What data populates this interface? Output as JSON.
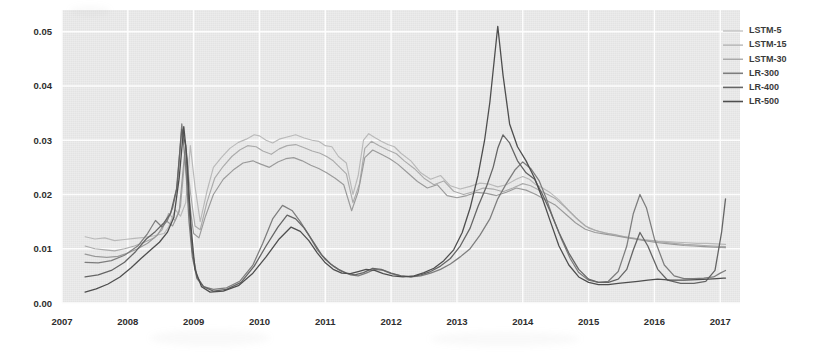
{
  "chart_data": {
    "type": "line",
    "title": "",
    "xlabel": "",
    "ylabel": "",
    "xlim": [
      2007.0,
      2017.3
    ],
    "ylim": [
      0.0,
      0.054
    ],
    "grid": true,
    "legend_position": "top-right",
    "x_ticks": [
      "2007",
      "2008",
      "2009",
      "2010",
      "2011",
      "2012",
      "2013",
      "2014",
      "2015",
      "2016",
      "2017"
    ],
    "x_tick_values": [
      2007,
      2008,
      2009,
      2010,
      2011,
      2012,
      2013,
      2014,
      2015,
      2016,
      2017
    ],
    "y_ticks": [
      "0.00",
      "0.01",
      "0.02",
      "0.03",
      "0.04",
      "0.05"
    ],
    "y_tick_values": [
      0.0,
      0.01,
      0.02,
      0.03,
      0.04,
      0.05
    ],
    "series": [
      {
        "name": "LSTM-5",
        "color": "#b9b9b9",
        "width": 1.15,
        "x": [
          2007.35,
          2007.5,
          2007.65,
          2007.8,
          2007.95,
          2008.1,
          2008.25,
          2008.4,
          2008.55,
          2008.62,
          2008.72,
          2008.8,
          2008.88,
          2008.95,
          2009.02,
          2009.1,
          2009.2,
          2009.3,
          2009.42,
          2009.55,
          2009.68,
          2009.8,
          2009.92,
          2010.0,
          2010.1,
          2010.2,
          2010.3,
          2010.42,
          2010.55,
          2010.68,
          2010.8,
          2010.9,
          2011.0,
          2011.1,
          2011.2,
          2011.32,
          2011.42,
          2011.5,
          2011.58,
          2011.66,
          2011.75,
          2011.85,
          2011.95,
          2012.05,
          2012.15,
          2012.3,
          2012.45,
          2012.6,
          2012.75,
          2012.9,
          2013.05,
          2013.2,
          2013.35,
          2013.5,
          2013.62,
          2013.75,
          2013.9,
          2014.0,
          2014.1,
          2014.2,
          2014.3,
          2014.42,
          2014.55,
          2014.7,
          2014.85,
          2015.0,
          2015.15,
          2015.3,
          2015.45,
          2015.6,
          2015.75,
          2015.9,
          2016.05,
          2016.2,
          2016.35,
          2016.5,
          2016.65,
          2016.8,
          2016.95,
          2017.08
        ],
        "y": [
          0.0122,
          0.0118,
          0.012,
          0.0115,
          0.0117,
          0.0119,
          0.0121,
          0.0124,
          0.0128,
          0.014,
          0.0172,
          0.016,
          0.0185,
          0.029,
          0.0215,
          0.015,
          0.0205,
          0.025,
          0.0268,
          0.0285,
          0.0296,
          0.0302,
          0.031,
          0.0308,
          0.03,
          0.0295,
          0.0302,
          0.0306,
          0.031,
          0.0304,
          0.03,
          0.0298,
          0.029,
          0.0288,
          0.027,
          0.0258,
          0.02,
          0.0235,
          0.03,
          0.0312,
          0.0305,
          0.0298,
          0.0292,
          0.0288,
          0.0276,
          0.0262,
          0.024,
          0.0228,
          0.0235,
          0.0216,
          0.021,
          0.0215,
          0.0221,
          0.0219,
          0.0214,
          0.0218,
          0.0228,
          0.0233,
          0.0228,
          0.0218,
          0.0212,
          0.0203,
          0.019,
          0.017,
          0.0152,
          0.0138,
          0.0132,
          0.0128,
          0.0124,
          0.0121,
          0.0118,
          0.0116,
          0.0114,
          0.0113,
          0.0112,
          0.0111,
          0.011,
          0.011,
          0.0109,
          0.0108
        ]
      },
      {
        "name": "LSTM-15",
        "color": "#ababab",
        "width": 1.15,
        "x": [
          2007.35,
          2007.5,
          2007.65,
          2007.8,
          2007.95,
          2008.1,
          2008.25,
          2008.4,
          2008.52,
          2008.62,
          2008.72,
          2008.8,
          2008.88,
          2008.95,
          2009.02,
          2009.1,
          2009.2,
          2009.32,
          2009.45,
          2009.58,
          2009.7,
          2009.82,
          2009.95,
          2010.05,
          2010.18,
          2010.3,
          2010.42,
          2010.55,
          2010.68,
          2010.8,
          2010.92,
          2011.02,
          2011.12,
          2011.22,
          2011.32,
          2011.42,
          2011.52,
          2011.6,
          2011.7,
          2011.82,
          2011.95,
          2012.08,
          2012.2,
          2012.35,
          2012.5,
          2012.65,
          2012.8,
          2012.95,
          2013.1,
          2013.25,
          2013.4,
          2013.55,
          2013.7,
          2013.85,
          2014.0,
          2014.12,
          2014.25,
          2014.38,
          2014.5,
          2014.65,
          2014.8,
          2014.95,
          2015.1,
          2015.25,
          2015.4,
          2015.55,
          2015.7,
          2015.85,
          2016.0,
          2016.15,
          2016.3,
          2016.45,
          2016.6,
          2016.75,
          2016.9,
          2017.08
        ],
        "y": [
          0.0105,
          0.01,
          0.0098,
          0.0096,
          0.01,
          0.0105,
          0.0112,
          0.012,
          0.0135,
          0.0165,
          0.0152,
          0.0178,
          0.0285,
          0.0205,
          0.0142,
          0.0135,
          0.0185,
          0.023,
          0.0252,
          0.027,
          0.0282,
          0.029,
          0.0288,
          0.028,
          0.0274,
          0.0284,
          0.029,
          0.0292,
          0.0286,
          0.028,
          0.0276,
          0.027,
          0.0262,
          0.025,
          0.0238,
          0.0185,
          0.022,
          0.0285,
          0.0298,
          0.029,
          0.0282,
          0.0275,
          0.0262,
          0.0248,
          0.023,
          0.0218,
          0.0225,
          0.0206,
          0.02,
          0.0205,
          0.0212,
          0.021,
          0.0205,
          0.0212,
          0.022,
          0.0216,
          0.0208,
          0.02,
          0.0192,
          0.0176,
          0.0158,
          0.0142,
          0.0134,
          0.0129,
          0.0126,
          0.0122,
          0.0119,
          0.0116,
          0.0114,
          0.0112,
          0.011,
          0.0108,
          0.0107,
          0.0106,
          0.0105,
          0.0104
        ]
      },
      {
        "name": "LSTM-30",
        "color": "#9a9a9a",
        "width": 1.15,
        "x": [
          2007.35,
          2007.5,
          2007.68,
          2007.85,
          2008.0,
          2008.15,
          2008.3,
          2008.45,
          2008.58,
          2008.68,
          2008.78,
          2008.86,
          2008.93,
          2009.0,
          2009.08,
          2009.18,
          2009.3,
          2009.45,
          2009.6,
          2009.75,
          2009.9,
          2010.02,
          2010.15,
          2010.28,
          2010.4,
          2010.52,
          2010.65,
          2010.78,
          2010.9,
          2011.02,
          2011.15,
          2011.28,
          2011.4,
          2011.5,
          2011.6,
          2011.72,
          2011.85,
          2011.98,
          2012.1,
          2012.25,
          2012.4,
          2012.55,
          2012.7,
          2012.85,
          2013.0,
          2013.15,
          2013.3,
          2013.45,
          2013.6,
          2013.75,
          2013.9,
          2014.05,
          2014.2,
          2014.35,
          2014.5,
          2014.65,
          2014.8,
          2014.95,
          2015.1,
          2015.25,
          2015.4,
          2015.55,
          2015.7,
          2015.85,
          2016.0,
          2016.15,
          2016.3,
          2016.45,
          2016.6,
          2016.75,
          2016.9,
          2017.08
        ],
        "y": [
          0.009,
          0.0086,
          0.0084,
          0.0086,
          0.0092,
          0.01,
          0.011,
          0.0125,
          0.0152,
          0.0142,
          0.0168,
          0.0272,
          0.019,
          0.0128,
          0.012,
          0.016,
          0.02,
          0.0228,
          0.0245,
          0.0258,
          0.0262,
          0.0256,
          0.025,
          0.026,
          0.0266,
          0.0268,
          0.0262,
          0.0254,
          0.0248,
          0.024,
          0.023,
          0.0218,
          0.017,
          0.0205,
          0.0268,
          0.0282,
          0.0274,
          0.0266,
          0.0256,
          0.024,
          0.0224,
          0.0212,
          0.0218,
          0.0198,
          0.0194,
          0.0198,
          0.0204,
          0.0202,
          0.0198,
          0.0204,
          0.0212,
          0.0208,
          0.02,
          0.019,
          0.018,
          0.0164,
          0.0148,
          0.0136,
          0.013,
          0.0127,
          0.0124,
          0.0121,
          0.0118,
          0.0115,
          0.0112,
          0.011,
          0.0108,
          0.0106,
          0.0105,
          0.0104,
          0.0103,
          0.0102
        ]
      },
      {
        "name": "LR-300",
        "color": "#7d7d7d",
        "width": 1.25,
        "x": [
          2007.35,
          2007.55,
          2007.75,
          2007.95,
          2008.15,
          2008.3,
          2008.42,
          2008.52,
          2008.6,
          2008.68,
          2008.75,
          2008.82,
          2008.88,
          2008.93,
          2008.98,
          2009.05,
          2009.15,
          2009.3,
          2009.5,
          2009.7,
          2009.9,
          2010.05,
          2010.2,
          2010.35,
          2010.5,
          2010.62,
          2010.75,
          2010.88,
          2011.0,
          2011.12,
          2011.25,
          2011.38,
          2011.5,
          2011.62,
          2011.75,
          2011.88,
          2012.0,
          2012.15,
          2012.3,
          2012.45,
          2012.6,
          2012.75,
          2012.9,
          2013.05,
          2013.2,
          2013.35,
          2013.5,
          2013.62,
          2013.75,
          2013.88,
          2014.0,
          2014.12,
          2014.25,
          2014.35,
          2014.45,
          2014.58,
          2014.72,
          2014.85,
          2015.0,
          2015.15,
          2015.3,
          2015.45,
          2015.58,
          2015.68,
          2015.78,
          2015.88,
          2016.0,
          2016.15,
          2016.3,
          2016.45,
          2016.6,
          2016.75,
          2016.9,
          2017.0,
          2017.08
        ],
        "y": [
          0.0075,
          0.0074,
          0.0078,
          0.0088,
          0.0105,
          0.0128,
          0.0152,
          0.014,
          0.0152,
          0.0175,
          0.0215,
          0.033,
          0.025,
          0.015,
          0.0085,
          0.0045,
          0.003,
          0.0025,
          0.0028,
          0.004,
          0.007,
          0.011,
          0.0155,
          0.018,
          0.017,
          0.015,
          0.0125,
          0.0098,
          0.008,
          0.0068,
          0.0058,
          0.0052,
          0.005,
          0.0055,
          0.0062,
          0.006,
          0.0054,
          0.005,
          0.0048,
          0.005,
          0.0055,
          0.0062,
          0.0072,
          0.0085,
          0.01,
          0.0125,
          0.0155,
          0.0192,
          0.022,
          0.0245,
          0.026,
          0.0248,
          0.0225,
          0.0195,
          0.016,
          0.012,
          0.0082,
          0.0056,
          0.0042,
          0.0038,
          0.004,
          0.0058,
          0.0105,
          0.0165,
          0.02,
          0.0175,
          0.0118,
          0.007,
          0.005,
          0.0045,
          0.0045,
          0.0046,
          0.0048,
          0.0055,
          0.006
        ]
      },
      {
        "name": "LR-400",
        "color": "#656565",
        "width": 1.3,
        "x": [
          2007.35,
          2007.55,
          2007.75,
          2007.95,
          2008.12,
          2008.28,
          2008.42,
          2008.55,
          2008.65,
          2008.74,
          2008.82,
          2008.88,
          2008.93,
          2008.98,
          2009.05,
          2009.15,
          2009.3,
          2009.5,
          2009.72,
          2009.92,
          2010.1,
          2010.28,
          2010.42,
          2010.55,
          2010.68,
          2010.82,
          2010.95,
          2011.08,
          2011.2,
          2011.32,
          2011.45,
          2011.58,
          2011.72,
          2011.85,
          2012.0,
          2012.15,
          2012.3,
          2012.45,
          2012.6,
          2012.75,
          2012.9,
          2013.05,
          2013.2,
          2013.32,
          2013.45,
          2013.55,
          2013.62,
          2013.7,
          2013.8,
          2013.92,
          2014.05,
          2014.18,
          2014.3,
          2014.42,
          2014.55,
          2014.7,
          2014.85,
          2015.0,
          2015.15,
          2015.3,
          2015.45,
          2015.58,
          2015.68,
          2015.78,
          2015.9,
          2016.05,
          2016.2,
          2016.4,
          2016.6,
          2016.78,
          2016.92,
          2017.02,
          2017.08
        ],
        "y": [
          0.0048,
          0.0052,
          0.006,
          0.0075,
          0.0095,
          0.0118,
          0.0132,
          0.0148,
          0.0165,
          0.021,
          0.032,
          0.029,
          0.018,
          0.0095,
          0.0048,
          0.003,
          0.0022,
          0.0025,
          0.0038,
          0.0068,
          0.0105,
          0.014,
          0.0162,
          0.0155,
          0.0138,
          0.0112,
          0.0088,
          0.0072,
          0.0062,
          0.0055,
          0.0052,
          0.0056,
          0.0064,
          0.0062,
          0.0055,
          0.005,
          0.0048,
          0.0052,
          0.0058,
          0.0068,
          0.0082,
          0.0105,
          0.0138,
          0.0178,
          0.0215,
          0.025,
          0.0285,
          0.031,
          0.0295,
          0.0262,
          0.024,
          0.0228,
          0.02,
          0.0168,
          0.013,
          0.0092,
          0.0062,
          0.0044,
          0.0038,
          0.0038,
          0.0044,
          0.0062,
          0.0098,
          0.013,
          0.0105,
          0.0062,
          0.0042,
          0.0036,
          0.0036,
          0.004,
          0.006,
          0.013,
          0.0192
        ]
      },
      {
        "name": "LR-500",
        "color": "#4e4e4e",
        "width": 1.3,
        "x": [
          2007.35,
          2007.52,
          2007.7,
          2007.88,
          2008.05,
          2008.2,
          2008.35,
          2008.48,
          2008.6,
          2008.7,
          2008.78,
          2008.85,
          2008.9,
          2008.96,
          2009.02,
          2009.12,
          2009.25,
          2009.45,
          2009.68,
          2009.9,
          2010.1,
          2010.3,
          2010.48,
          2010.62,
          2010.75,
          2010.88,
          2011.0,
          2011.12,
          2011.25,
          2011.38,
          2011.5,
          2011.62,
          2011.75,
          2011.88,
          2012.02,
          2012.18,
          2012.35,
          2012.5,
          2012.65,
          2012.8,
          2012.95,
          2013.08,
          2013.2,
          2013.32,
          2013.42,
          2013.5,
          2013.56,
          2013.62,
          2013.7,
          2013.8,
          2013.92,
          2014.05,
          2014.18,
          2014.3,
          2014.42,
          2014.55,
          2014.7,
          2014.85,
          2015.0,
          2015.15,
          2015.3,
          2015.45,
          2015.6,
          2015.75,
          2015.9,
          2016.05,
          2016.25,
          2016.45,
          2016.65,
          2016.82,
          2016.95,
          2017.05,
          2017.08
        ],
        "y": [
          0.002,
          0.0026,
          0.0035,
          0.0048,
          0.0065,
          0.0082,
          0.0098,
          0.0112,
          0.013,
          0.0158,
          0.023,
          0.0325,
          0.0265,
          0.014,
          0.0062,
          0.003,
          0.002,
          0.0022,
          0.0032,
          0.0055,
          0.0085,
          0.0118,
          0.014,
          0.0132,
          0.0115,
          0.0092,
          0.0074,
          0.0062,
          0.0055,
          0.0054,
          0.0058,
          0.0062,
          0.006,
          0.0054,
          0.005,
          0.0048,
          0.005,
          0.0056,
          0.0064,
          0.0078,
          0.0098,
          0.013,
          0.0175,
          0.0235,
          0.03,
          0.037,
          0.044,
          0.051,
          0.042,
          0.033,
          0.0288,
          0.0262,
          0.023,
          0.0192,
          0.015,
          0.0105,
          0.007,
          0.0048,
          0.0038,
          0.0034,
          0.0034,
          0.0036,
          0.0038,
          0.004,
          0.0042,
          0.0044,
          0.0042,
          0.0042,
          0.0043,
          0.0044,
          0.0045,
          0.0046,
          0.0046
        ]
      }
    ]
  },
  "legend": {
    "items": [
      {
        "label": "LSTM-5",
        "color": "#b9b9b9"
      },
      {
        "label": "LSTM-15",
        "color": "#ababab"
      },
      {
        "label": "LSTM-30",
        "color": "#9a9a9a"
      },
      {
        "label": "LR-300",
        "color": "#7d7d7d"
      },
      {
        "label": "LR-400",
        "color": "#656565"
      },
      {
        "label": "LR-500",
        "color": "#4e4e4e"
      }
    ]
  },
  "style": {
    "plot_background": "#e9e9e9",
    "grid_color": "#fdfdfd",
    "page_background": "#ffffff",
    "tick_text_color": "#2e2e2e"
  }
}
